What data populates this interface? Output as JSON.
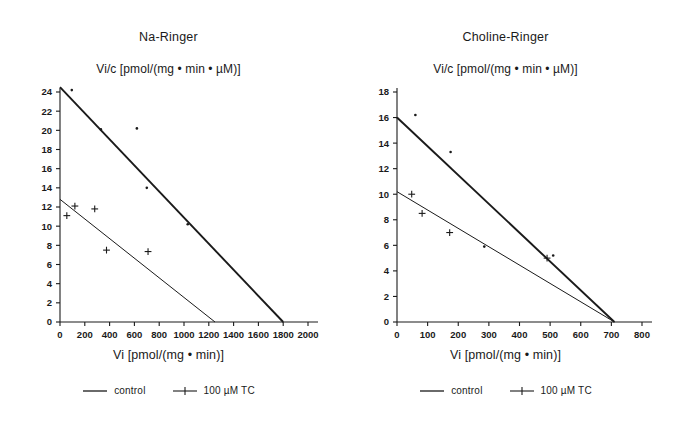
{
  "figure": {
    "background": "#ffffff",
    "line_color": "#1a1a1a"
  },
  "legend": {
    "control_label": "control",
    "tc_label": "100 µM TC",
    "control_marker": "line-marker",
    "tc_marker": "plus-line-marker"
  },
  "chart_data": [
    {
      "type": "scatter",
      "title": "Na-Ringer",
      "xlabel": "Vi [pmol/(mg • min)]",
      "ylabel": "Vi/c [pmol/(mg • min • µM)]",
      "xlim": [
        0,
        2000
      ],
      "ylim": [
        0,
        24
      ],
      "xticks": [
        0,
        200,
        400,
        600,
        800,
        1000,
        1200,
        1400,
        1600,
        1800,
        2000
      ],
      "xtick_labels": [
        "0",
        "200",
        "400",
        "600",
        "800",
        "1000",
        "1200",
        "1400",
        "1600",
        "1800",
        "2000"
      ],
      "yticks": [
        0,
        2,
        4,
        6,
        8,
        10,
        12,
        14,
        16,
        18,
        20,
        22,
        24
      ],
      "ytick_labels": [
        "0",
        "2",
        "4",
        "6",
        "8",
        "10",
        "12",
        "14",
        "16",
        "18",
        "20",
        "22",
        "24"
      ],
      "grid": false,
      "legend_position": "below",
      "series": [
        {
          "name": "control",
          "marker": "dot",
          "points": [
            {
              "x": 95,
              "y": 24.2
            },
            {
              "x": 330,
              "y": 20.1
            },
            {
              "x": 620,
              "y": 20.2
            },
            {
              "x": 700,
              "y": 14.0
            },
            {
              "x": 1030,
              "y": 10.2
            }
          ],
          "fit_line": {
            "x0": 0,
            "y0": 24.5,
            "x1": 1800,
            "y1": 0
          }
        },
        {
          "name": "100 µM TC",
          "marker": "plus",
          "points": [
            {
              "x": 55,
              "y": 11.1
            },
            {
              "x": 120,
              "y": 12.1
            },
            {
              "x": 280,
              "y": 11.8
            },
            {
              "x": 375,
              "y": 7.5
            },
            {
              "x": 710,
              "y": 7.35
            }
          ],
          "fit_line": {
            "x0": 0,
            "y0": 12.8,
            "x1": 1250,
            "y1": 0
          }
        }
      ]
    },
    {
      "type": "scatter",
      "title": "Choline-Ringer",
      "xlabel": "Vi [pmol/(mg • min)]",
      "ylabel": "Vi/c [pmol/(mg • min • µM)]",
      "xlim": [
        0,
        800
      ],
      "ylim": [
        0,
        18
      ],
      "xticks": [
        0,
        100,
        200,
        300,
        400,
        500,
        600,
        700,
        800
      ],
      "xtick_labels": [
        "0",
        "100",
        "200",
        "300",
        "400",
        "500",
        "600",
        "700",
        "800"
      ],
      "yticks": [
        0,
        2,
        4,
        6,
        8,
        10,
        12,
        14,
        16,
        18
      ],
      "ytick_labels": [
        "0",
        "2",
        "4",
        "6",
        "8",
        "10",
        "12",
        "14",
        "16",
        "18"
      ],
      "grid": false,
      "legend_position": "below",
      "series": [
        {
          "name": "control",
          "marker": "dot",
          "points": [
            {
              "x": 60,
              "y": 16.2
            },
            {
              "x": 175,
              "y": 13.3
            },
            {
              "x": 285,
              "y": 5.9
            },
            {
              "x": 510,
              "y": 5.2
            }
          ],
          "fit_line": {
            "x0": 0,
            "y0": 16.0,
            "x1": 710,
            "y1": 0
          }
        },
        {
          "name": "100 µM TC",
          "marker": "plus",
          "points": [
            {
              "x": 48,
              "y": 10.0
            },
            {
              "x": 82,
              "y": 8.5
            },
            {
              "x": 172,
              "y": 7.0
            },
            {
              "x": 490,
              "y": 5.0
            }
          ],
          "fit_line": {
            "x0": 0,
            "y0": 10.2,
            "x1": 710,
            "y1": 0
          }
        }
      ]
    }
  ]
}
